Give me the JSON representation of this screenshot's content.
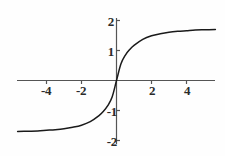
{
  "chart_data": {
    "type": "line",
    "title": "",
    "xlabel": "",
    "ylabel": "",
    "xlim": [
      -5.65,
      5.65
    ],
    "ylim": [
      -2.1,
      2.15
    ],
    "grid": false,
    "legend": null,
    "axes_style": "centered-cross",
    "curve_color": "#1a1a1a",
    "axis_color": "#555555",
    "xticks": [
      -4,
      -2,
      2,
      4
    ],
    "xtick_labels": [
      "-4",
      "-2",
      "2",
      "4"
    ],
    "yticks": [
      2,
      1,
      -1,
      -2
    ],
    "ytick_labels": [
      "2",
      "1",
      "-1",
      "-2"
    ],
    "series": [
      {
        "name": "sigmoid",
        "x": [
          -5.65,
          -5.0,
          -4.5,
          -4.0,
          -3.5,
          -3.0,
          -2.5,
          -2.0,
          -1.5,
          -1.0,
          -0.75,
          -0.5,
          -0.25,
          0,
          0.25,
          0.5,
          0.75,
          1.0,
          1.5,
          2.0,
          2.5,
          3.0,
          3.5,
          4.0,
          4.5,
          5.0,
          5.65
        ],
        "y": [
          -1.7,
          -1.69,
          -1.68,
          -1.66,
          -1.64,
          -1.61,
          -1.56,
          -1.49,
          -1.37,
          -1.17,
          -1.03,
          -0.84,
          -0.55,
          0,
          0.55,
          0.84,
          1.03,
          1.17,
          1.37,
          1.49,
          1.56,
          1.61,
          1.64,
          1.66,
          1.68,
          1.69,
          1.7
        ]
      }
    ]
  },
  "ticks": {
    "x": [
      {
        "label": "-4",
        "value": -4
      },
      {
        "label": "-2",
        "value": -2
      },
      {
        "label": "2",
        "value": 2
      },
      {
        "label": "4",
        "value": 4
      }
    ],
    "y": [
      {
        "label": "2",
        "value": 2
      },
      {
        "label": "1",
        "value": 1
      },
      {
        "label": "-1",
        "value": -1
      },
      {
        "label": "-2",
        "value": -2
      }
    ]
  }
}
